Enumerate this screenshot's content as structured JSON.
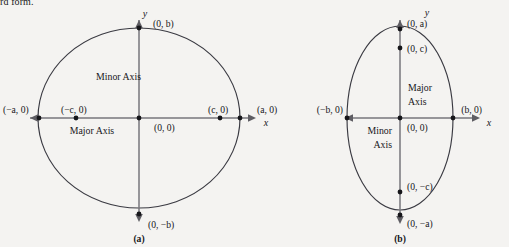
{
  "page": {
    "partial_text_top": "rd form.",
    "background_color": "#f4f3f1",
    "curve_color": "#3a3a42",
    "axis_color": "#77767b",
    "dot_color": "#16161a"
  },
  "figures": [
    {
      "id": "figure-a",
      "caption": "(a)",
      "type": "ellipse-horizontal-major",
      "axis_labels": {
        "x": "x",
        "y": "y"
      },
      "center_label": "(0, 0)",
      "axis_names": {
        "major": "Major Axis",
        "minor": "Minor Axis"
      },
      "points": [
        {
          "name": "left-vertex",
          "label": "(−a, 0)"
        },
        {
          "name": "left-focus",
          "label": "(−c, 0)"
        },
        {
          "name": "origin",
          "label": "(0, 0)"
        },
        {
          "name": "right-focus",
          "label": "(c, 0)"
        },
        {
          "name": "right-vertex",
          "label": "(a, 0)"
        },
        {
          "name": "top-covertex",
          "label": "(0, b)"
        },
        {
          "name": "bottom-covertex",
          "label": "(0, −b)"
        }
      ]
    },
    {
      "id": "figure-b",
      "caption": "(b)",
      "type": "ellipse-vertical-major",
      "axis_labels": {
        "x": "x",
        "y": "y"
      },
      "center_label": "(0, 0)",
      "axis_names": {
        "major": "Major Axis",
        "minor": "Minor Axis"
      },
      "points": [
        {
          "name": "top-vertex",
          "label": "(0, a)"
        },
        {
          "name": "top-focus",
          "label": "(0, c)"
        },
        {
          "name": "origin",
          "label": "(0, 0)"
        },
        {
          "name": "bottom-focus",
          "label": "(0, −c)"
        },
        {
          "name": "bottom-vertex",
          "label": "(0, −a)"
        },
        {
          "name": "left-covertex",
          "label": "(−b, 0)"
        },
        {
          "name": "right-covertex",
          "label": "(b, 0)"
        }
      ]
    }
  ],
  "labels": {
    "a_minus_a_0": "(−a, 0)",
    "a_minus_c_0": "(−c, 0)",
    "a_origin": "(0, 0)",
    "a_c_0": "(c, 0)",
    "a_a_0": "(a, 0)",
    "a_0_b": "(0, b)",
    "a_0_minus_b": "(0, −b)",
    "a_major": "Major Axis",
    "a_minor": "Minor Axis",
    "a_x": "x",
    "a_y": "y",
    "a_caption": "(a)",
    "b_0_a": "(0, a)",
    "b_0_c": "(0, c)",
    "b_origin": "(0, 0)",
    "b_0_minus_c": "(0, −c)",
    "b_0_minus_a": "(0, −a)",
    "b_minus_b_0": "(−b, 0)",
    "b_b_0": "(b, 0)",
    "b_major_1": "Major",
    "b_major_2": "Axis",
    "b_minor_1": "Minor",
    "b_minor_2": "Axis",
    "b_x": "x",
    "b_y": "y",
    "b_caption": "(b)"
  }
}
